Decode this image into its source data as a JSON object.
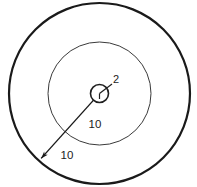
{
  "figure": {
    "canvas": {
      "width": 197,
      "height": 187,
      "background": "#ffffff"
    },
    "center": {
      "x": 99.5,
      "y": 93.5
    },
    "colors": {
      "outer_stroke": "#1a1a1a",
      "middle_stroke": "#3a3a3a",
      "inner_stroke": "#1f1f1f",
      "dimension_stroke": "#1a1a1a",
      "text": "#1c1c1c",
      "background": "#ffffff"
    }
  },
  "circles": [
    {
      "name": "outer-circle",
      "radius_px": 90.5,
      "stroke_width": 2.2,
      "stroke": "#1a1a1a",
      "fill": "none"
    },
    {
      "name": "middle-circle",
      "radius_px": 51.5,
      "stroke_width": 1.0,
      "stroke": "#3a3a3a",
      "fill": "none"
    },
    {
      "name": "inner-circle",
      "radius_px": 9.0,
      "stroke_width": 1.6,
      "stroke": "#1f1f1f",
      "fill": "none"
    }
  ],
  "dimensions": [
    {
      "name": "inner-radius-dimension",
      "label": "2",
      "value": 2,
      "label_x": 116,
      "label_y": 80,
      "leader": {
        "x1": 99.5,
        "y1": 93.5,
        "x2": 112,
        "y2": 84
      },
      "describes": "radius of the small center circle"
    },
    {
      "name": "middle-annulus-dimension",
      "label": "10",
      "value": 10,
      "label_x": 95,
      "label_y": 125,
      "describes": "distance from center to middle circle"
    },
    {
      "name": "outer-annulus-dimension",
      "label": "10",
      "value": 10,
      "label_x": 67,
      "label_y": 156,
      "describes": "distance from middle circle to outer circle"
    }
  ],
  "dimension_line": {
    "name": "radial-dimension-line",
    "from": {
      "x": 99.5,
      "y": 93.5
    },
    "to": {
      "x": 37,
      "y": 163
    },
    "arrowheads": "both",
    "stroke_width": 1.4
  }
}
